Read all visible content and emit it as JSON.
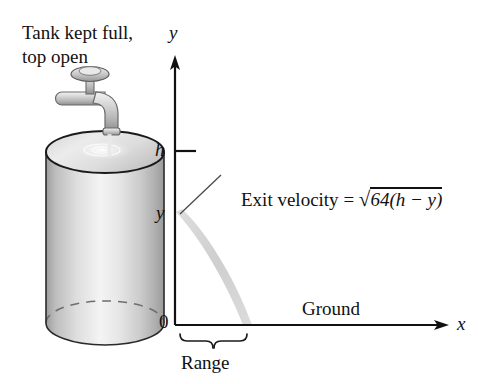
{
  "figure": {
    "title_caption_line1": "Tank kept full,",
    "title_caption_line2": "top open",
    "y_axis_label": "y",
    "x_axis_label": "x",
    "origin_label": "0",
    "height_tick_label": "h",
    "level_tick_label": "y",
    "ground_label": "Ground",
    "range_label": "Range",
    "equation": {
      "lhs": "Exit velocity",
      "equals": "=",
      "radical_sign": "√",
      "radicand": "64(h − y)",
      "full_text": "Exit velocity = √64(h − y)"
    },
    "colors": {
      "background": "#ffffff",
      "ink": "#111111",
      "tank_light": "#f2f2f2",
      "tank_mid": "#d8d8d8",
      "tank_dark": "#9a9a9a",
      "jet_gray": "#cfcfcf",
      "outline": "#1a1a1a"
    }
  }
}
